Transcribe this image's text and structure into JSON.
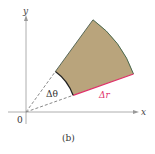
{
  "figure": {
    "caption": "(b)",
    "axes": {
      "x_label": "x",
      "y_label": "y",
      "origin_label": "0"
    },
    "sector": {
      "angle_label": "Δθ",
      "radial_label": "Δr",
      "fill_color": "#b9a47c",
      "edge_color": "#4a5a4a",
      "inner_arc_color": "#222222",
      "radial_edge_color": "#e0306a",
      "inner_radius_px": 50,
      "outer_radius_px": 114,
      "start_angle_deg": 19.5,
      "end_angle_deg": 54
    },
    "colors": {
      "axis": "#999999",
      "dashed_ray": "#555555"
    }
  }
}
